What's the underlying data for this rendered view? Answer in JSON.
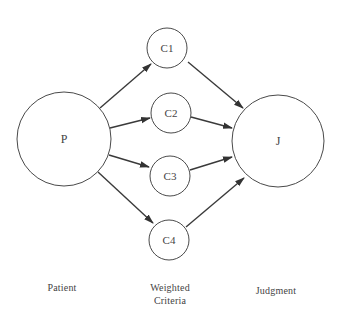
{
  "diagram": {
    "nodes": [
      {
        "id": "P",
        "label": "P",
        "cx": 64,
        "cy": 139,
        "r": 47
      },
      {
        "id": "C1",
        "label": "C1",
        "cx": 167,
        "cy": 48,
        "r": 20
      },
      {
        "id": "C2",
        "label": "C2",
        "cx": 171,
        "cy": 113,
        "r": 20
      },
      {
        "id": "C3",
        "label": "C3",
        "cx": 170,
        "cy": 176,
        "r": 20
      },
      {
        "id": "C4",
        "label": "C4",
        "cx": 169,
        "cy": 240,
        "r": 20
      },
      {
        "id": "J",
        "label": "J",
        "cx": 278,
        "cy": 141,
        "r": 46
      }
    ],
    "edges": [
      {
        "from": "P",
        "to": "C1"
      },
      {
        "from": "P",
        "to": "C2"
      },
      {
        "from": "P",
        "to": "C3"
      },
      {
        "from": "P",
        "to": "C4"
      },
      {
        "from": "C1",
        "to": "J"
      },
      {
        "from": "C2",
        "to": "J"
      },
      {
        "from": "C3",
        "to": "J"
      },
      {
        "from": "C4",
        "to": "J"
      }
    ],
    "captions": {
      "patient": "Patient",
      "criteria_line1": "Weighted",
      "criteria_line2": "Criteria",
      "judgment": "Judgment"
    },
    "colors": {
      "stroke": "#4a4a4a",
      "arrow": "#333333"
    }
  }
}
